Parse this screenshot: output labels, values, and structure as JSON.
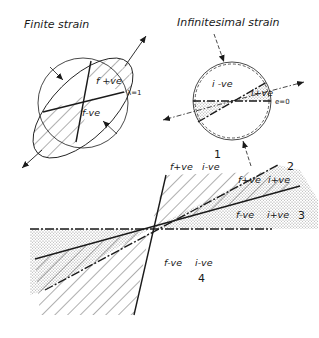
{
  "finite": {
    "title": "Finite strain",
    "positive_label": "f +ve",
    "negative_label": "f-ve",
    "lambda_label": "λ=1"
  },
  "infinitesimal": {
    "title": "Infinitesimal strain",
    "negative_label": "i -ve",
    "positive_label": "i+ve",
    "e_label": "e=0"
  },
  "fan": {
    "sector1": {
      "number": "1",
      "f": "f+ve",
      "i": "i-ve"
    },
    "sector2": {
      "number": "2",
      "f": "f+ve",
      "i": "i+ve"
    },
    "sector3": {
      "number": "3",
      "f": "f-ve",
      "i": "i+ve"
    },
    "sector4": {
      "number": "4",
      "f": "f-ve",
      "i": "i-ve"
    }
  },
  "colors": {
    "ink": "#1a1a1a",
    "background": "#ffffff"
  }
}
